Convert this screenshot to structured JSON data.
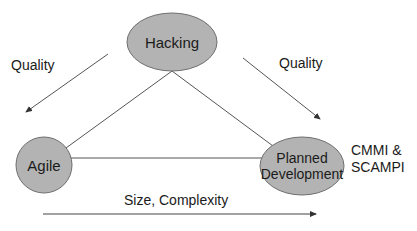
{
  "diagram": {
    "nodes": {
      "hacking": {
        "label": "Hacking"
      },
      "agile": {
        "label": "Agile"
      },
      "planned": {
        "label_line1": "Planned",
        "label_line2": "Development"
      }
    },
    "annotations": {
      "quality_left": "Quality",
      "quality_right": "Quality",
      "cmmi_line1": "CMMI &",
      "cmmi_line2": "SCAMPI",
      "axis": "Size, Complexity"
    },
    "colors": {
      "node_fill": "#b3b3b3",
      "node_stroke": "#6e6e6e",
      "line": "#555555",
      "text": "#1a1a1a"
    }
  }
}
